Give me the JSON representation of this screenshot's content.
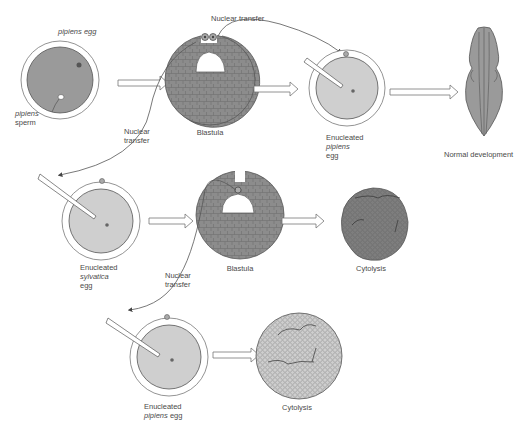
{
  "diagram": {
    "colors": {
      "egg_dark": "#9a9a9a",
      "egg_light": "#cfcfcf",
      "blastula": "#8c8c8c",
      "outline": "#555555",
      "line": "#666666",
      "cytolysis": "#7d7d7d",
      "cytolysis_light": "#c8c8c8"
    },
    "row1": {
      "egg_label_species": "pipiens",
      "egg_label_word": "egg",
      "sperm_label_species": "pipiens",
      "sperm_label_word": "sperm",
      "blastula_label": "Blastula",
      "transfer_top_label": "Nuclear transfer",
      "recipient_line1": "Enucleated",
      "recipient_line2": "pipiens",
      "recipient_line3": "egg",
      "outcome_label": "Normal development"
    },
    "row2": {
      "transfer_label_line1": "Nuclear",
      "transfer_label_line2": "transfer",
      "recipient_line1": "Enucleated",
      "recipient_line2": "sylvatica",
      "recipient_line3": "egg",
      "blastula_label": "Blastula",
      "outcome_label": "Cytolysis"
    },
    "row3": {
      "transfer_label_line1": "Nuclear",
      "transfer_label_line2": "transfer",
      "recipient_line1": "Enucleated",
      "recipient_line2_species": "pipiens",
      "recipient_line2_word": "egg",
      "outcome_label": "Cytolysis"
    }
  }
}
